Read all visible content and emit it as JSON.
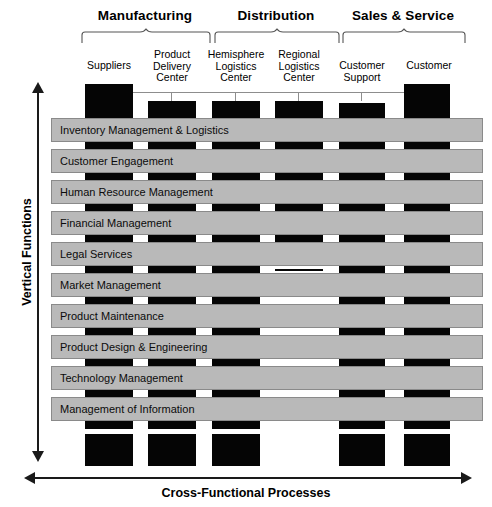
{
  "diagram": {
    "title_axes": {
      "vertical_axis_label": "Vertical Functions",
      "horizontal_axis_label": "Cross-Functional Processes"
    },
    "groups": [
      {
        "label": "Manufacturing",
        "left": 78,
        "width": 134
      },
      {
        "label": "Distribution",
        "left": 212,
        "width": 128
      },
      {
        "label": "Sales & Service",
        "right_left": 340,
        "width": 126,
        "left": 340
      }
    ],
    "columns": [
      {
        "caption": "Suppliers",
        "left": 85,
        "width": 48,
        "tall": true,
        "bottom_bar": true
      },
      {
        "caption": "Product\nDelivery\nCenter",
        "left": 148,
        "width": 48,
        "tall": false,
        "bottom_bar": true
      },
      {
        "caption": "Hemisphere\nLogistics\nCenter",
        "left": 212,
        "width": 48,
        "tall": false,
        "bottom_bar": true
      },
      {
        "caption": "Regional\nLogistics\nCenter",
        "left": 275,
        "width": 48,
        "tall": false,
        "bottom_bar": false
      },
      {
        "caption": "Customer\nSupport",
        "left": 339,
        "width": 46,
        "tall": false,
        "bottom_bar": true
      },
      {
        "caption": "Customer",
        "left": 404,
        "width": 46,
        "tall": true,
        "bottom_bar": true
      }
    ],
    "rows": [
      {
        "label": "Inventory Management & Logistics"
      },
      {
        "label": "Customer Engagement"
      },
      {
        "label": "Human Resource Management"
      },
      {
        "label": "Financial Management"
      },
      {
        "label": "Legal Services"
      },
      {
        "label": "Market Management"
      },
      {
        "label": "Product Maintenance"
      },
      {
        "label": "Product Design & Engineering"
      },
      {
        "label": "Technology Management"
      },
      {
        "label": "Management of Information"
      }
    ],
    "band_segments": [
      {
        "after_row": 0,
        "cells": [
          "full",
          "full",
          "full",
          "full",
          "full",
          "full"
        ]
      },
      {
        "after_row": 1,
        "cells": [
          "full",
          "full",
          "full",
          "full",
          "full",
          "full"
        ]
      },
      {
        "after_row": 2,
        "cells": [
          "full",
          "full",
          "full",
          "full",
          "full",
          "full"
        ]
      },
      {
        "after_row": 3,
        "cells": [
          "full",
          "full",
          "full",
          "full",
          "full",
          "full"
        ]
      },
      {
        "after_row": 4,
        "cells": [
          "full",
          "full",
          "full",
          "thin",
          "full",
          "full"
        ]
      },
      {
        "after_row": 5,
        "cells": [
          "full",
          "full",
          "full",
          "none",
          "full",
          "full"
        ]
      },
      {
        "after_row": 6,
        "cells": [
          "full",
          "full",
          "full",
          "none",
          "full",
          "full"
        ]
      },
      {
        "after_row": 7,
        "cells": [
          "full",
          "full",
          "full",
          "none",
          "full",
          "full"
        ]
      },
      {
        "after_row": 8,
        "cells": [
          "full",
          "full",
          "full",
          "none",
          "full",
          "full"
        ]
      },
      {
        "after_row": 9,
        "cells": [
          "full",
          "full",
          "full",
          "none",
          "full",
          "full"
        ]
      }
    ],
    "colors": {
      "bar_black": "#050505",
      "row_gray": "#b9b9b9",
      "row_border": "#8a8a8a",
      "axis": "#1a1a1a",
      "connector": "#8d8d8d",
      "background": "#ffffff"
    },
    "geometry": {
      "row_left": 51,
      "row_right": 483,
      "first_row_top": 118,
      "row_height": 24,
      "row_pitch": 31,
      "top_block_top": 89,
      "top_block_tall_top": 84,
      "top_block_bottom": 118,
      "bottom_block_top": 434,
      "bottom_block_height": 32,
      "band_height": 7
    }
  }
}
